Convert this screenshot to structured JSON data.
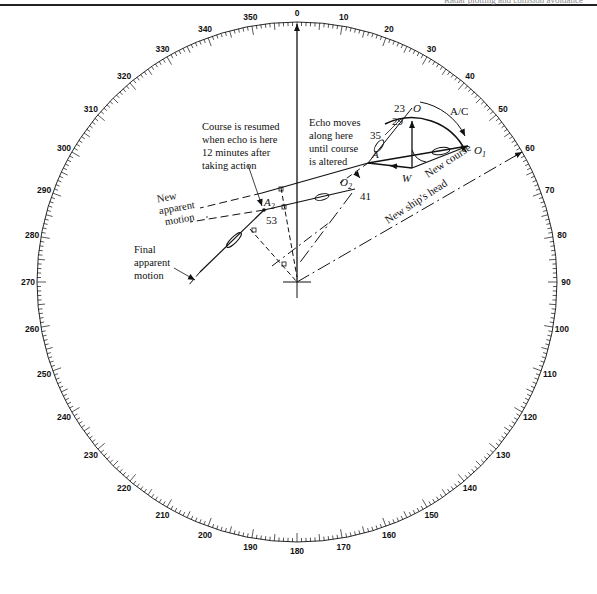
{
  "header": {
    "text": "Radar plotting and collision avoidance"
  },
  "diagram": {
    "type": "radar plotting sheet / bearing ring",
    "center": [
      297,
      282
    ],
    "ring_radius": 260,
    "ring_labels": [
      "0",
      "10",
      "20",
      "30",
      "40",
      "50",
      "60",
      "70",
      "80",
      "90",
      "100",
      "110",
      "120",
      "130",
      "140",
      "150",
      "160",
      "170",
      "180",
      "190",
      "200",
      "210",
      "220",
      "230",
      "240",
      "250",
      "260",
      "270",
      "280",
      "290",
      "300",
      "310",
      "320",
      "330",
      "340",
      "350"
    ],
    "points": {
      "O": {
        "label": "O",
        "time": "23"
      },
      "A": {
        "label": "A",
        "time": "35"
      },
      "W": {
        "label": "W"
      },
      "O1": {
        "label": "O",
        "sub": "1"
      },
      "O2": {
        "label": "O",
        "sub": "2",
        "time": "41"
      },
      "A2": {
        "label": "A",
        "sub": "2",
        "time": "53"
      },
      "mid": {
        "time": "29"
      }
    },
    "labels": {
      "ac": "A/C",
      "new_course": "New course",
      "new_ships_head": "New ship's head",
      "echo_moves": [
        "Echo moves",
        "along here",
        "until course",
        "is altered"
      ],
      "course_resumed": [
        "Course is resumed",
        "when echo is here",
        "12 minutes after",
        "taking action"
      ],
      "new_apparent_motion": [
        "New",
        "apparent",
        "motion"
      ],
      "final_apparent_motion": [
        "Final",
        "apparent",
        "motion"
      ]
    }
  }
}
